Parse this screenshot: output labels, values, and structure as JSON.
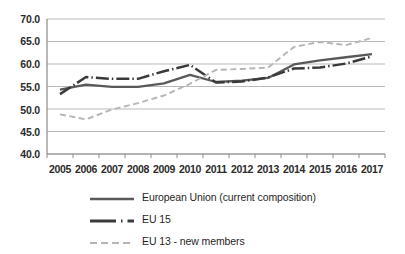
{
  "chart_data": {
    "type": "line",
    "title": "",
    "xlabel": "",
    "ylabel": "",
    "categories": [
      "2005",
      "2006",
      "2007",
      "2008",
      "2009",
      "2010",
      "2011",
      "2012",
      "2013",
      "2014",
      "2015",
      "2016",
      "2017"
    ],
    "ylim": [
      40.0,
      70.0
    ],
    "yticks": [
      40.0,
      45.0,
      50.0,
      55.0,
      60.0,
      65.0,
      70.0
    ],
    "ytick_labels": [
      "40.0",
      "45.0",
      "50.0",
      "55.0",
      "60.0",
      "65.0",
      "70.0"
    ],
    "grid": true,
    "legend_position": "bottom",
    "series": [
      {
        "name": "European Union (current composition)",
        "style": "solid",
        "color": "#595959",
        "values": [
          54.3,
          55.4,
          54.9,
          54.9,
          55.7,
          57.6,
          56.0,
          56.3,
          56.9,
          59.9,
          60.8,
          61.5,
          62.2
        ]
      },
      {
        "name": "EU 15",
        "style": "dash-dot",
        "color": "#3a3a3a",
        "values": [
          53.3,
          57.1,
          56.7,
          56.7,
          58.4,
          59.8,
          55.9,
          56.1,
          57.0,
          59.0,
          59.2,
          60.1,
          61.7
        ]
      },
      {
        "name": "EU 13 - new members",
        "style": "dashed",
        "color": "#b5b5b5",
        "values": [
          48.8,
          47.7,
          49.9,
          51.3,
          53.0,
          55.6,
          58.7,
          58.9,
          59.2,
          63.8,
          64.9,
          64.2,
          65.8
        ]
      }
    ]
  },
  "axis": {
    "y_labels": [
      "70.0",
      "65.0",
      "60.0",
      "55.0",
      "50.0",
      "45.0",
      "40.0"
    ],
    "x_labels": [
      "2005",
      "2006",
      "2007",
      "2008",
      "2009",
      "2010",
      "2011",
      "2012",
      "2013",
      "2014",
      "2015",
      "2016",
      "2017"
    ]
  },
  "legend": {
    "items": [
      {
        "label": "European Union (current composition)",
        "key": "solid-line-key"
      },
      {
        "label": "EU 15",
        "key": "dash-dot-line-key"
      },
      {
        "label": "EU 13 - new members",
        "key": "dashed-line-key"
      }
    ]
  },
  "colors": {
    "series_eu": "#595959",
    "series_eu15": "#3a3a3a",
    "series_eu13": "#b5b5b5",
    "gridline": "#b9b9b9",
    "axis": "#8a8a8a",
    "text": "#1f1f1f"
  }
}
